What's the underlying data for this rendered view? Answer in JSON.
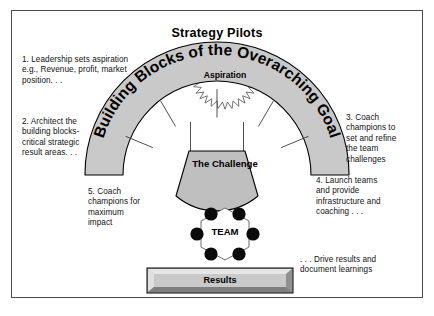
{
  "diagram": {
    "title": "Strategy Pilots",
    "arch_label": "Building Blocks of the Overarching Goal",
    "shapes": {
      "aspiration": "Aspiration",
      "challenge": "The\nChallenge",
      "team": "TEAM",
      "results": "Results"
    },
    "notes": [
      {
        "id": "note-1",
        "text": "1.  Leadership sets aspiration\ne.g.,  Revenue, profit, market\nposition. . ."
      },
      {
        "id": "note-2",
        "text": "2. Architect the\nbuilding blocks-\ncritical strategic\nresult areas. . ."
      },
      {
        "id": "note-3",
        "text": "3. Coach\nchampions to\nset and refine\nthe team\nchallenges"
      },
      {
        "id": "note-4",
        "text": "4. Launch teams\nand provide\ninfrastructure and\ncoaching . . ."
      },
      {
        "id": "note-5",
        "text": "5. Coach\nchampions for\nmaximum\nimpact"
      },
      {
        "id": "note-6",
        "text": ". . . Drive results and\ndocument learnings"
      }
    ],
    "colors": {
      "shape_fill": "#c9c9c9",
      "challenge_fill": "#bfbfbf",
      "results_fill": "#c9c9c9",
      "outline": "#000000",
      "border": "#4a4a4a",
      "text": "#111111",
      "background": "#ffffff"
    }
  }
}
